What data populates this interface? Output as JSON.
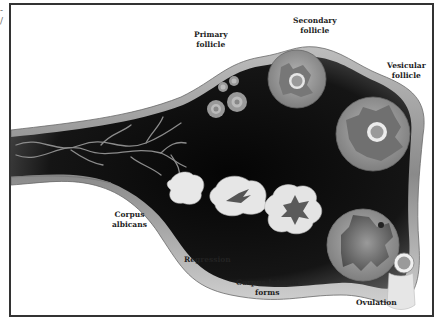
{
  "corner_marks": {
    "top": "-",
    "bottom": "/"
  },
  "diagram": {
    "title": "",
    "colors": {
      "stroma_dark": "#0c0c0c",
      "surface_band": "#9a9a9a",
      "follicle": "#8f8f8f",
      "corpus": "#e6e6e6",
      "border": "#333333"
    },
    "labels": {
      "primary_follicle": "Primary\nfollicle",
      "secondary_follicle": "Secondary\nfollicle",
      "vesicular_follicle": "Vesicular\nfollicle",
      "corpus_albicans": "Corpus\nalbicans",
      "regression": "Regression",
      "corpus_luteum_forms": "Corpus luteum\nforms",
      "ovulation": "Ovulation"
    }
  }
}
